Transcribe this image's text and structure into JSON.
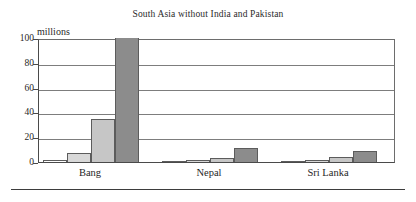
{
  "chart_data": {
    "type": "bar",
    "title": "South Asia without India and Pakistan",
    "subtitle": "",
    "xlabel": "",
    "ylabel": "millions",
    "ylim": [
      0,
      100
    ],
    "yticks": [
      0,
      20,
      40,
      60,
      80,
      100
    ],
    "ytick_labels": [
      "0",
      "20",
      "40",
      "60",
      "80",
      "100"
    ],
    "grid": true,
    "legend": "none",
    "categories": [
      "Bang",
      "Nepal",
      "Sri Lanka"
    ],
    "series": [
      {
        "name": "series-1",
        "color": "#ffffff",
        "values": [
          1.5,
          0.8,
          1.0
        ]
      },
      {
        "name": "series-2",
        "color": "#d8d8d8",
        "values": [
          7.0,
          2.0,
          2.0
        ]
      },
      {
        "name": "series-3",
        "color": "#c6c6c6",
        "values": [
          35.0,
          3.0,
          4.0
        ]
      },
      {
        "name": "series-4",
        "color": "#8c8c8c",
        "values": [
          100.0,
          11.0,
          8.5
        ]
      }
    ]
  },
  "colors": {
    "axis": "#4a4a4a",
    "gridline": "#7d7d7d",
    "bar_outline": "#5c5c5c",
    "text": "#1f1f1f",
    "background": "#ffffff"
  }
}
